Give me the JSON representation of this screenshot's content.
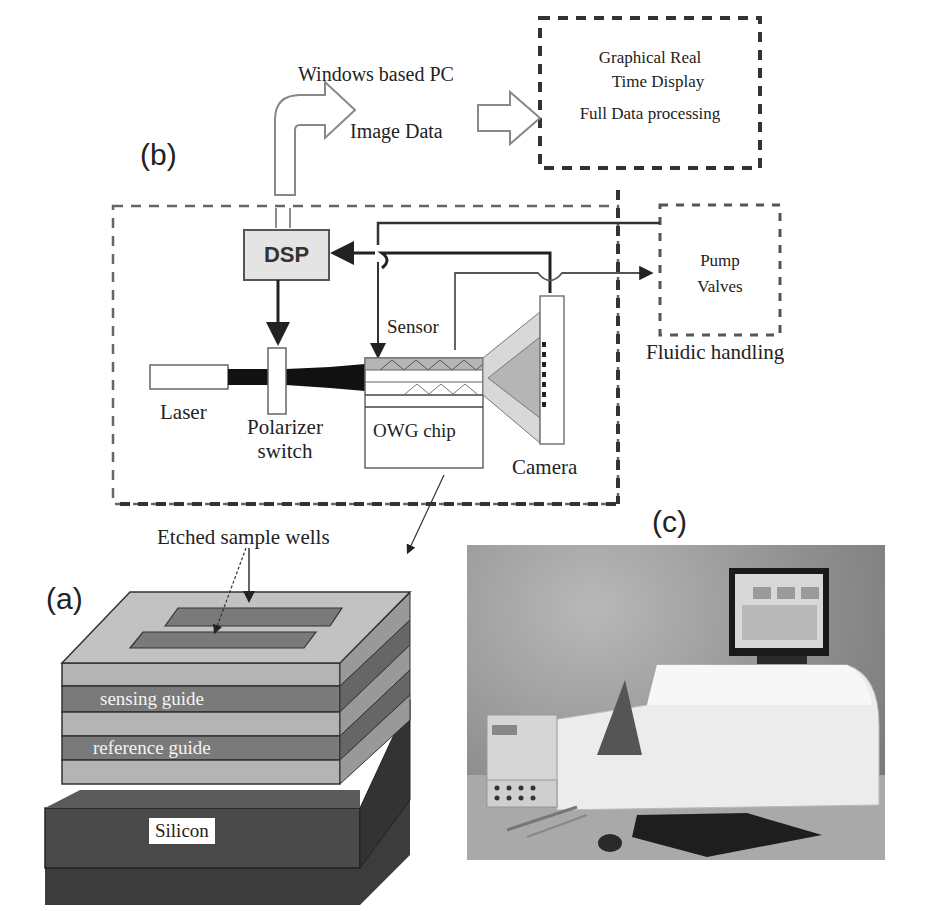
{
  "figure": {
    "panels": {
      "a": {
        "label": "(a)",
        "annotation": "Etched sample wells",
        "layers": [
          "sensing guide",
          "reference guide"
        ],
        "substrate": "Silicon"
      },
      "b": {
        "label": "(b)",
        "pc_title": "Windows based PC",
        "image_data": "Image Data",
        "display_box": [
          "Graphical Real",
          "Time Display",
          "Full Data processing"
        ],
        "dsp": "DSP",
        "laser": "Laser",
        "polarizer": [
          "Polarizer",
          "switch"
        ],
        "sensor": "Sensor",
        "chip": "OWG chip",
        "camera": "Camera",
        "fluidic_box": [
          "Pump",
          "Valves"
        ],
        "fluidic_label": "Fluidic handling"
      },
      "c": {
        "label": "(c)",
        "photo_description": "instrument-photo"
      }
    },
    "colors": {
      "line": "#333333",
      "dash": "#555555",
      "dsp_fill": "#e4e4e4",
      "layer_light": "#b4b4b4",
      "layer_dark": "#7a7a7a",
      "silicon": "#4a4a4a"
    }
  }
}
